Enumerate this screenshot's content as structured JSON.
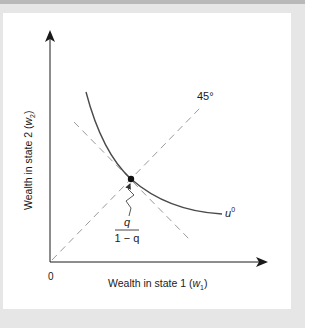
{
  "figure": {
    "x_axis_label": "Wealth in state 1 (",
    "x_axis_var": "w",
    "x_axis_sub": "1",
    "x_axis_close": ")",
    "y_axis_label": "Wealth in state 2 (",
    "y_axis_var": "w",
    "y_axis_sub": "2",
    "y_axis_close": ")",
    "origin_label": "0",
    "certainty_line_label": "45°",
    "indifference_curve_label": "u",
    "indifference_curve_sup": "0",
    "slope_numerator": "q",
    "slope_denominator": "1 − q",
    "colors": {
      "axis": "#1a1a1a",
      "curve": "#4a4a4a",
      "dashed": "#9a9a9a",
      "panel": "#ffffff",
      "background": "#e6e6e6"
    }
  }
}
